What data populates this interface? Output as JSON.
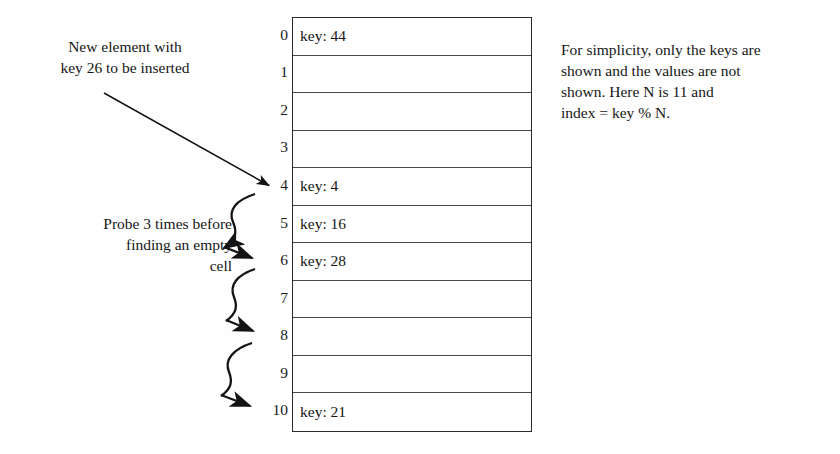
{
  "figure": {
    "background_color": "#fefefe",
    "ink_color": "#1a1a1a"
  },
  "annotations": {
    "new_element": {
      "text": "New element with\nkey 26 to be inserted",
      "align": "center"
    },
    "probe": {
      "text": "Probe 3 times before\nfinding an empty\ncell",
      "align": "right"
    },
    "note": {
      "text": "For simplicity, only the keys are\nshown and the values are not\nshown. Here N is 11 and\nindex = key % N.",
      "align": "left"
    }
  },
  "hash_table": {
    "size": 11,
    "modulus": 11,
    "inserted_key": 26,
    "probe_count": 3,
    "home_index": 4,
    "final_index": 7,
    "slots": [
      {
        "index": "0",
        "value": "key: 44",
        "occupied": true
      },
      {
        "index": "1",
        "value": "",
        "occupied": false
      },
      {
        "index": "2",
        "value": "",
        "occupied": false
      },
      {
        "index": "3",
        "value": "",
        "occupied": false
      },
      {
        "index": "4",
        "value": "key: 4",
        "occupied": true
      },
      {
        "index": "5",
        "value": "key: 16",
        "occupied": true
      },
      {
        "index": "6",
        "value": "key: 28",
        "occupied": true
      },
      {
        "index": "7",
        "value": "",
        "occupied": false
      },
      {
        "index": "8",
        "value": "",
        "occupied": false
      },
      {
        "index": "9",
        "value": "",
        "occupied": false
      },
      {
        "index": "10",
        "value": "key: 21",
        "occupied": true
      }
    ]
  },
  "arrows": {
    "insert_pointer": {
      "name": "insert-arrow",
      "from_label": "New element with key 26 to be inserted",
      "to_index": "4"
    },
    "probe_steps": [
      {
        "name": "probe-arrow-4-to-5",
        "from_index": "4",
        "to_index": "5"
      },
      {
        "name": "probe-arrow-5-to-6",
        "from_index": "5",
        "to_index": "6"
      },
      {
        "name": "probe-arrow-6-to-7",
        "from_index": "6",
        "to_index": "7"
      }
    ]
  }
}
